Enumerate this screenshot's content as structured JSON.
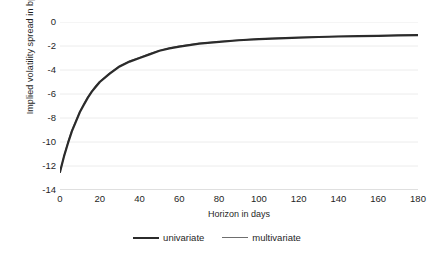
{
  "chart_data": {
    "type": "line",
    "title": "",
    "xlabel": "Horizon in days",
    "ylabel": "Implied volatility spread in bp",
    "xlim": [
      0,
      180
    ],
    "ylim": [
      -14,
      0
    ],
    "xticks": [
      0,
      20,
      40,
      60,
      80,
      100,
      120,
      140,
      160,
      180
    ],
    "yticks": [
      0,
      -2,
      -4,
      -6,
      -8,
      -10,
      -12,
      -14
    ],
    "xtick_labels": [
      "0",
      "20",
      "40",
      "60",
      "80",
      "100",
      "120",
      "140",
      "160",
      "180"
    ],
    "ytick_labels": [
      "0",
      "-2",
      "-4",
      "-6",
      "-8",
      "-10",
      "-12",
      "-14"
    ],
    "grid": "horizontal",
    "grid_color": "#ececec",
    "legend_position": "bottom",
    "x": [
      0,
      2,
      4,
      6,
      8,
      10,
      12,
      14,
      16,
      18,
      20,
      25,
      30,
      35,
      40,
      45,
      50,
      55,
      60,
      70,
      80,
      90,
      100,
      110,
      120,
      130,
      140,
      150,
      160,
      170,
      180
    ],
    "series": [
      {
        "name": "univariate",
        "color": "#2b2b2b",
        "linewidth": 2.2,
        "values": [
          -12.5,
          -11.2,
          -10.1,
          -9.1,
          -8.3,
          -7.5,
          -6.9,
          -6.3,
          -5.8,
          -5.4,
          -5.0,
          -4.3,
          -3.7,
          -3.3,
          -3.0,
          -2.7,
          -2.4,
          -2.2,
          -2.05,
          -1.8,
          -1.65,
          -1.52,
          -1.43,
          -1.36,
          -1.3,
          -1.25,
          -1.21,
          -1.18,
          -1.15,
          -1.12,
          -1.1
        ]
      },
      {
        "name": "multivariate",
        "color": "#6e6e6e",
        "linewidth": 1.1,
        "values": [
          -12.5,
          -11.15,
          -10.0,
          -9.0,
          -8.2,
          -7.45,
          -6.8,
          -6.25,
          -5.75,
          -5.3,
          -4.95,
          -4.25,
          -3.65,
          -3.25,
          -2.95,
          -2.65,
          -2.38,
          -2.16,
          -2.0,
          -1.78,
          -1.62,
          -1.5,
          -1.41,
          -1.34,
          -1.29,
          -1.24,
          -1.2,
          -1.17,
          -1.14,
          -1.11,
          -1.09
        ]
      }
    ],
    "legend": [
      {
        "label": "univariate",
        "color": "#2b2b2b",
        "linewidth": 2.2
      },
      {
        "label": "multivariate",
        "color": "#6e6e6e",
        "linewidth": 1.1
      }
    ]
  }
}
